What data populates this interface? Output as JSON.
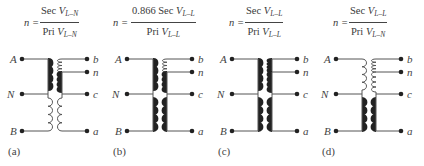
{
  "figure": {
    "panels": [
      {
        "id": "a",
        "caption": "(a)",
        "formula": {
          "lhs": "n =",
          "numerator_prefix": "Sec ",
          "numerator_var": "V",
          "numerator_sub": "L–N",
          "denominator_prefix": "Pri ",
          "denominator_var": "V",
          "denominator_sub": "L–N"
        },
        "primary_terminals": [
          "A",
          "N",
          "B"
        ],
        "secondary_terminals": [
          "b",
          "n",
          "c",
          "a"
        ],
        "primary_upper_winding": "heavy",
        "primary_lower_winding": "light",
        "secondary_upper_winding": "light",
        "secondary_middle_winding": "heavy",
        "secondary_lower_winding": "light"
      },
      {
        "id": "b",
        "caption": "(b)",
        "formula": {
          "lhs": "n =",
          "numerator_prefix": "0.866 Sec ",
          "numerator_var": "V",
          "numerator_sub": "L–L",
          "denominator_prefix": "Pri ",
          "denominator_var": "V",
          "denominator_sub": "L–L"
        },
        "primary_terminals": [
          "A",
          "N",
          "B"
        ],
        "secondary_terminals": [
          "b",
          "n",
          "c",
          "a"
        ],
        "primary_upper_winding": "heavy",
        "primary_lower_winding": "heavy",
        "secondary_upper_winding": "light",
        "secondary_middle_winding": "heavy",
        "secondary_lower_winding": "heavy"
      },
      {
        "id": "c",
        "caption": "(c)",
        "formula": {
          "lhs": "n =",
          "numerator_prefix": "Sec ",
          "numerator_var": "V",
          "numerator_sub": "L–L",
          "denominator_prefix": "Pri ",
          "denominator_var": "V",
          "denominator_sub": "L–L"
        },
        "primary_terminals": [
          "A",
          "N",
          "B"
        ],
        "secondary_terminals": [
          "b",
          "n",
          "c",
          "a"
        ],
        "primary_upper_winding": "heavy",
        "primary_lower_winding": "heavy",
        "secondary_upper_winding": "heavy",
        "secondary_middle_winding": "heavy",
        "secondary_lower_winding": "heavy"
      },
      {
        "id": "d",
        "caption": "(d)",
        "formula": {
          "lhs": "n =",
          "numerator_prefix": "Sec ",
          "numerator_var": "V",
          "numerator_sub": "L–L",
          "denominator_prefix": "Pri ",
          "denominator_var": "V",
          "denominator_sub": "L–N"
        },
        "primary_terminals": [
          "A",
          "N",
          "B"
        ],
        "secondary_terminals": [
          "b",
          "n",
          "c",
          "a"
        ],
        "primary_upper_winding": "light",
        "primary_lower_winding": "heavy",
        "secondary_upper_winding": "light",
        "secondary_middle_winding": "light",
        "secondary_lower_winding": "heavy"
      }
    ]
  }
}
